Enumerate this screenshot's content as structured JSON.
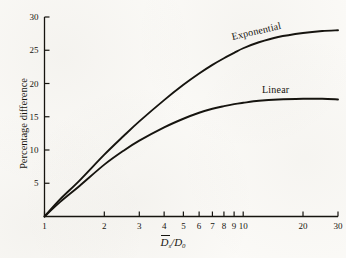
{
  "figure": {
    "background_color": "#fbfaf7",
    "ink_color": "#16140f"
  },
  "chart_data": {
    "type": "line",
    "title": "",
    "subtitle": "",
    "xlabel": "D̄s/D0",
    "xlabel_parts": {
      "numerator": "D",
      "numerator_sub": "s",
      "separator": "/",
      "denominator": "D",
      "denominator_sub": "0",
      "numerator_overbar": true
    },
    "ylabel": "Percentage difference",
    "xscale": "log",
    "yscale": "linear",
    "xlim": [
      1,
      30
    ],
    "ylim": [
      0,
      30
    ],
    "grid": false,
    "legend_position": "inline-curve-labels",
    "xticks": [
      1,
      2,
      3,
      4,
      5,
      6,
      7,
      8,
      9,
      10,
      20,
      30
    ],
    "xtick_labels": [
      "1",
      "2",
      "3",
      "4",
      "5",
      "6",
      "7",
      "8",
      "9",
      "10",
      "20",
      "30"
    ],
    "yticks": [
      5,
      10,
      15,
      20,
      25,
      30
    ],
    "ytick_labels": [
      "5",
      "10",
      "15",
      "20",
      "25",
      "30"
    ],
    "series": [
      {
        "name": "Exponential",
        "label": "Exponential",
        "color": "#16140f",
        "x": [
          1,
          1.2,
          1.5,
          2,
          2.5,
          3,
          4,
          5,
          6,
          7,
          8,
          9,
          10,
          12,
          15,
          20,
          25,
          30
        ],
        "values": [
          0,
          2.6,
          5.4,
          9.3,
          12.1,
          14.3,
          17.5,
          19.8,
          21.5,
          22.8,
          23.8,
          24.6,
          25.3,
          26.2,
          27.0,
          27.6,
          27.9,
          28.0
        ]
      },
      {
        "name": "Linear",
        "label": "Linear",
        "color": "#16140f",
        "x": [
          1,
          1.2,
          1.5,
          2,
          2.5,
          3,
          4,
          5,
          6,
          7,
          8,
          9,
          10,
          12,
          15,
          20,
          25,
          30
        ],
        "values": [
          0,
          2.2,
          4.6,
          7.8,
          9.9,
          11.4,
          13.4,
          14.7,
          15.6,
          16.2,
          16.6,
          16.9,
          17.1,
          17.4,
          17.6,
          17.7,
          17.7,
          17.6
        ]
      }
    ],
    "annotations": [
      {
        "text": "Exponential",
        "x": 11.5,
        "y": 26.5,
        "rotation": -13
      },
      {
        "text": "Linear",
        "x": 15.5,
        "y": 19.3,
        "rotation": 0
      }
    ]
  }
}
